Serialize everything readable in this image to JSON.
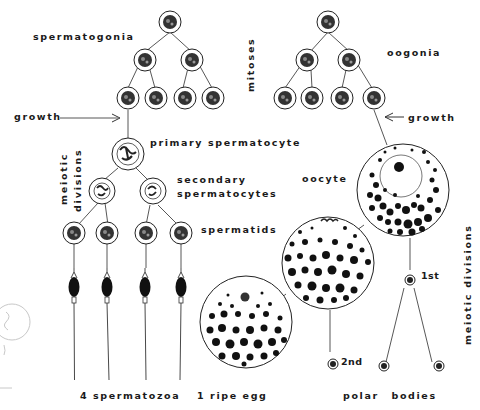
{
  "diagram": {
    "labels": {
      "spermatogonia": "spermatogonia",
      "mitoses": "mitoses",
      "oogonia": "oogonia",
      "growth_left": "growth",
      "growth_right": "growth",
      "primary_spermatocyte": "primary spermatocyte",
      "meiotic_divisions_left_1": "meiotic",
      "meiotic_divisions_left_2": "divisions",
      "secondary_spermatocytes_1": "secondary",
      "secondary_spermatocytes_2": "spermatocytes",
      "spermatids": "spermatids",
      "oocyte": "oocyte",
      "first_polar": "1st",
      "second_polar": "2nd",
      "meiotic_divisions_right": "meiotic    divisions",
      "spermatozoa": "4 spermatozoa",
      "ripe_egg": "1 ripe egg",
      "polar_bodies": "polar bodies"
    },
    "colors": {
      "ink": "#1a1a1a",
      "background": "#ffffff",
      "pencil": "#c8c8c8"
    }
  }
}
